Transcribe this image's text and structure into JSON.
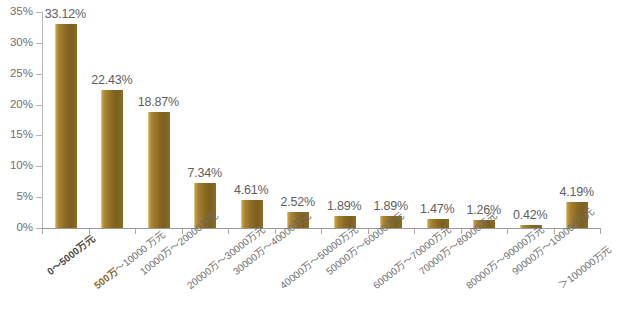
{
  "chart_data": {
    "type": "bar",
    "title": "",
    "subtitle": "",
    "xlabel": "",
    "ylabel": "",
    "ylim": [
      0,
      35
    ],
    "ytick_labels": [
      "0%",
      "5%",
      "10%",
      "15%",
      "20%",
      "25%",
      "30%",
      "35%"
    ],
    "ytick_values": [
      0,
      5,
      10,
      15,
      20,
      25,
      30,
      35
    ],
    "grid": false,
    "legend": null,
    "legend_position": "none",
    "value_suffix": "%",
    "bar_color": "#8a6a23",
    "bar_highlight_color": "#c9a24a",
    "axis_color": "#a8a8a8",
    "text_color": "#6d6d6d",
    "background": "#ffffff",
    "categories": [
      "0～5000万元",
      "500万～10000 万元",
      "10000万～20000万元",
      "20000万～30000万元",
      "30000万～40000万元",
      "40000万～50000万元",
      "50000万～60000万元",
      "60000万～70000万元",
      "70000万～80000万元",
      "80000万～90000万元",
      "90000万～100000万元",
      "＞100000万元"
    ],
    "values": [
      33.12,
      22.43,
      18.87,
      7.34,
      4.61,
      2.52,
      1.89,
      1.89,
      1.47,
      1.26,
      0.42,
      4.19
    ],
    "data_labels": [
      "33.12%",
      "22.43%",
      "18.87%",
      "7.34%",
      "4.61%",
      "2.52%",
      "1.89%",
      "1.89%",
      "1.47%",
      "1.26%",
      "0.42%",
      "4.19%"
    ],
    "category_label_parts": {
      "second_prefix": "500万",
      "second_rest": "～10000 万元"
    }
  }
}
